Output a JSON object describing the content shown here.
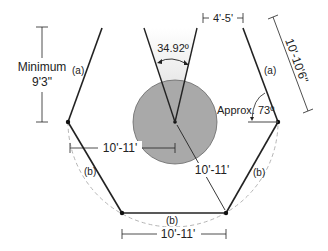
{
  "diagram": {
    "labels": {
      "min_height_line1": "Minimum",
      "min_height_line2": "9'3\"",
      "top_opening": "4'-5'",
      "angle_wedge": "34.92º",
      "side_length": "10'-10'6\"",
      "angle_side": "Approx. 73º",
      "wall_a_left": "(a)",
      "wall_a_right": "(a)",
      "wall_b_left": "(b)",
      "wall_b_right": "(b)",
      "wall_b_bottom": "(b)",
      "radius_horizontal": "10'-11'",
      "radius_diagonal": "10'-11'",
      "bottom_width": "10'-11'"
    },
    "colors": {
      "line": "#222222",
      "circle_fill": "#a9a9a9",
      "circle_stroke": "#555555",
      "wedge_fill": "#e4e4e4",
      "dashed_arc": "#b0b0b0"
    }
  }
}
